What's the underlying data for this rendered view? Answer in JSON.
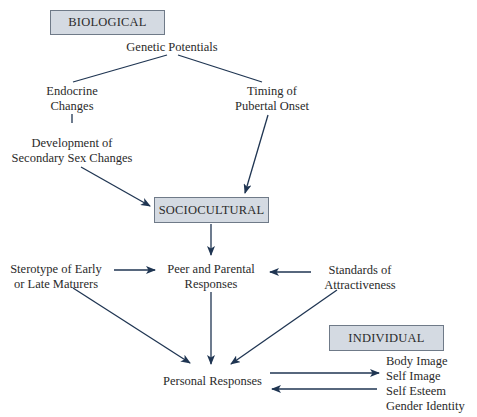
{
  "diagram": {
    "sections": {
      "biological": "BIOLOGICAL",
      "sociocultural": "SOCIOCULTURAL",
      "individual": "INDIVIDUAL"
    },
    "nodes": {
      "genetic": "Genetic Potentials",
      "endocrine_1": "Endocrine",
      "endocrine_2": "Changes",
      "timing_1": "Timing of",
      "timing_2": "Pubertal Onset",
      "development_1": "Development of",
      "development_2": "Secondary Sex Changes",
      "stereotype_1": "Sterotype of Early",
      "stereotype_2": "or Late Maturers",
      "peer_1": "Peer and Parental",
      "peer_2": "Responses",
      "standards_1": "Standards of",
      "standards_2": "Attractiveness",
      "personal": "Personal Responses",
      "outcomes": [
        "Body Image",
        "Self Image",
        "Self Esteem",
        "Gender Identity"
      ]
    },
    "edges": [
      {
        "from": "Genetic Potentials",
        "to": "Endocrine Changes",
        "arrow": false
      },
      {
        "from": "Genetic Potentials",
        "to": "Timing of Pubertal Onset",
        "arrow": false
      },
      {
        "from": "Endocrine Changes",
        "to": "Development of Secondary Sex Changes",
        "arrow": false
      },
      {
        "from": "Development of Secondary Sex Changes",
        "to": "SOCIOCULTURAL",
        "arrow": true
      },
      {
        "from": "Timing of Pubertal Onset",
        "to": "SOCIOCULTURAL",
        "arrow": true
      },
      {
        "from": "SOCIOCULTURAL",
        "to": "Peer and Parental Responses",
        "arrow": true
      },
      {
        "from": "Sterotype of Early or Late Maturers",
        "to": "Peer and Parental Responses",
        "arrow": true
      },
      {
        "from": "Standards of Attractiveness",
        "to": "Peer and Parental Responses",
        "arrow": true
      },
      {
        "from": "Sterotype of Early or Late Maturers",
        "to": "Personal Responses",
        "arrow": true
      },
      {
        "from": "Peer and Parental Responses",
        "to": "Personal Responses",
        "arrow": true
      },
      {
        "from": "Standards of Attractiveness",
        "to": "Personal Responses",
        "arrow": true
      },
      {
        "from": "Personal Responses",
        "to": "INDIVIDUAL outcomes",
        "arrow": true
      },
      {
        "from": "INDIVIDUAL outcomes",
        "to": "Personal Responses",
        "arrow": true
      }
    ]
  },
  "colors": {
    "line": "#1f3552",
    "box_fill": "#d4dae2",
    "box_border": "#6f7a88"
  }
}
